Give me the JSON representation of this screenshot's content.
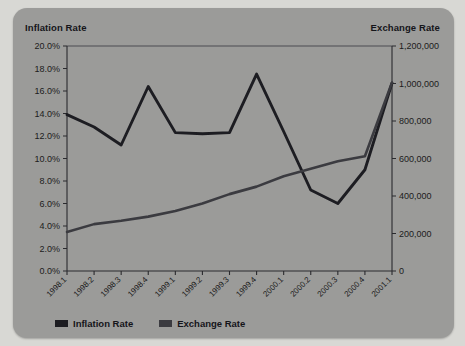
{
  "panel": {
    "background_color": "#9b9b99",
    "page_background_color": "#d8d8d4"
  },
  "left_axis_title": "Inflation Rate",
  "right_axis_title": "Exchange Rate",
  "legend": {
    "items": [
      {
        "label": "Inflation Rate",
        "color": "#1d1d22",
        "icon": "legend-swatch-icon"
      },
      {
        "label": "Exchange Rate",
        "color": "#3b3b40",
        "icon": "legend-swatch-icon"
      }
    ]
  },
  "chart_data": {
    "type": "line",
    "title": "",
    "xlabel": "",
    "grid": false,
    "legend_position": "bottom-left",
    "categories": [
      "1998.1",
      "1998.2",
      "1998.3",
      "1998.4",
      "1999.1",
      "1999.2",
      "1999.3",
      "1999.4",
      "2000.1",
      "2000.2",
      "2000.3",
      "2000.4",
      "2001.1"
    ],
    "axes": [
      {
        "id": "left",
        "label": "Inflation Rate",
        "side": "left",
        "ylim": [
          0,
          20
        ],
        "tick_values": [
          0,
          2,
          4,
          6,
          8,
          10,
          12,
          14,
          16,
          18,
          20
        ],
        "tick_labels": [
          "0.0%",
          "2.0%",
          "4.0%",
          "6.0%",
          "8.0%",
          "10.0%",
          "12.0%",
          "14.0%",
          "16.0%",
          "18.0%",
          "20.0%"
        ]
      },
      {
        "id": "right",
        "label": "Exchange Rate",
        "side": "right",
        "ylim": [
          0,
          1200000
        ],
        "tick_values": [
          0,
          200000,
          400000,
          600000,
          800000,
          1000000,
          1200000
        ],
        "tick_labels": [
          "0",
          "200,000",
          "400,000",
          "600,000",
          "800,000",
          "1,000,000",
          "1,200,000"
        ]
      }
    ],
    "series": [
      {
        "name": "Inflation Rate",
        "axis": "left",
        "color": "#1d1d22",
        "unit": "percent",
        "values": [
          13.9,
          12.8,
          11.2,
          16.4,
          12.3,
          12.2,
          12.3,
          17.5,
          12.4,
          7.2,
          6.0,
          9.0,
          16.7
        ]
      },
      {
        "name": "Exchange Rate",
        "axis": "right",
        "color": "#3b3b40",
        "unit": "currency",
        "values": [
          208000,
          250000,
          268000,
          290000,
          320000,
          360000,
          410000,
          450000,
          505000,
          545000,
          585000,
          612000,
          1005000
        ]
      }
    ]
  }
}
